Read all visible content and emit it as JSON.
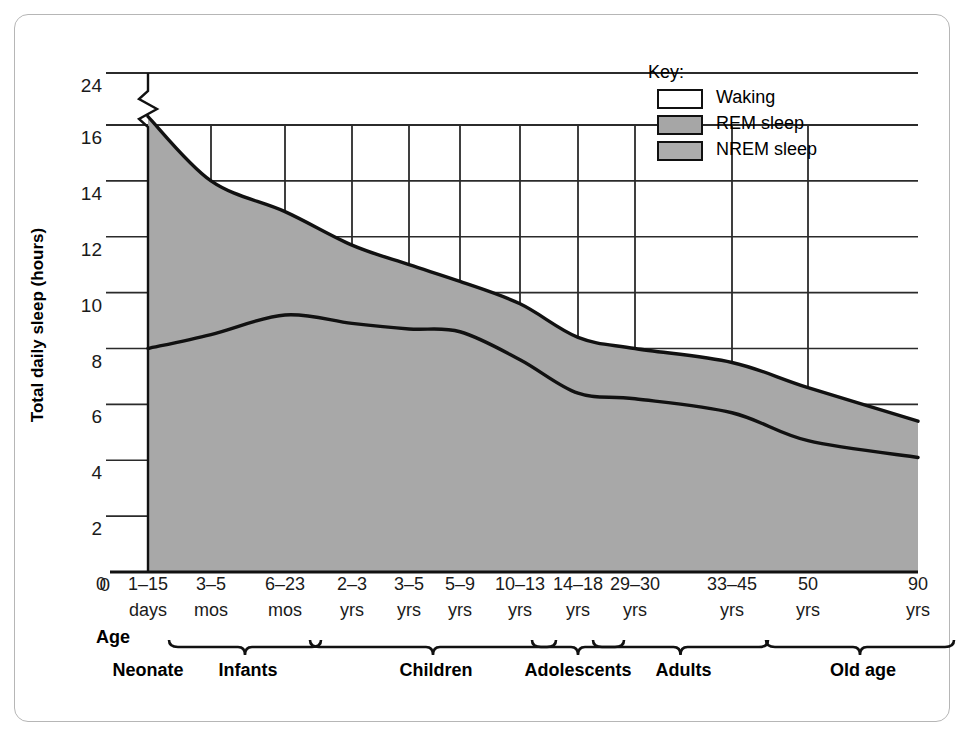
{
  "chart_data": {
    "type": "area",
    "title": "",
    "xlabel": "Age",
    "ylabel": "Total daily sleep (hours)",
    "ylim": [
      0,
      24
    ],
    "grid": true,
    "axis_break": {
      "between": [
        16,
        24
      ],
      "axis": "y"
    },
    "yticks": [
      {
        "value": 0,
        "label": "0"
      },
      {
        "value": 2,
        "label": "2"
      },
      {
        "value": 4,
        "label": "4"
      },
      {
        "value": 6,
        "label": "6"
      },
      {
        "value": 8,
        "label": "8"
      },
      {
        "value": 10,
        "label": "10"
      },
      {
        "value": 12,
        "label": "12"
      },
      {
        "value": 14,
        "label": "14"
      },
      {
        "value": 16,
        "label": "16"
      },
      {
        "value": 24,
        "label": "24"
      }
    ],
    "categories": [
      {
        "label": "1–15",
        "unit": "days",
        "group": "Neonate"
      },
      {
        "label": "3–5",
        "unit": "mos",
        "group": "Infants"
      },
      {
        "label": "6–23",
        "unit": "mos",
        "group": "Infants"
      },
      {
        "label": "2–3",
        "unit": "yrs",
        "group": "Children"
      },
      {
        "label": "3–5",
        "unit": "yrs",
        "group": "Children"
      },
      {
        "label": "5–9",
        "unit": "yrs",
        "group": "Children"
      },
      {
        "label": "10–13",
        "unit": "yrs",
        "group": "Children"
      },
      {
        "label": "14–18",
        "unit": "yrs",
        "group": "Adolescents"
      },
      {
        "label": "29–30",
        "unit": "yrs",
        "group": "Adults"
      },
      {
        "label": "33–45",
        "unit": "yrs",
        "group": "Adults"
      },
      {
        "label": "50",
        "unit": "yrs",
        "group": "Old age"
      },
      {
        "label": "90",
        "unit": "yrs",
        "group": "Old age"
      }
    ],
    "groups": [
      {
        "label": "Neonate",
        "from": "1–15 days",
        "to": "1–15 days",
        "bracket": false
      },
      {
        "label": "Infants",
        "from": "3–5 mos",
        "to": "6–23 mos",
        "bracket": true
      },
      {
        "label": "Children",
        "from": "2–3 yrs",
        "to": "10–13 yrs",
        "bracket": true
      },
      {
        "label": "Adolescents",
        "from": "14–18 yrs",
        "to": "14–18 yrs",
        "bracket": true
      },
      {
        "label": "Adults",
        "from": "29–30 yrs",
        "to": "33–45 yrs",
        "bracket": true
      },
      {
        "label": "Old age",
        "from": "50 yrs",
        "to": "90 yrs",
        "bracket": true
      }
    ],
    "series": [
      {
        "name": "Total sleep (top of REM band)",
        "description": "Upper boundary: total daily sleep = NREM + REM. Area above this line is Waking.",
        "values": [
          16.3,
          14.0,
          12.9,
          11.7,
          11.0,
          10.4,
          9.6,
          8.4,
          8.0,
          7.5,
          6.6,
          5.4
        ]
      },
      {
        "name": "NREM sleep (boundary between NREM and REM)",
        "description": "Lower boundary: hours of NREM sleep. Band between the two lines is REM sleep.",
        "values": [
          8.0,
          8.5,
          9.2,
          8.9,
          8.7,
          8.6,
          7.6,
          6.4,
          6.2,
          5.7,
          4.7,
          4.1
        ]
      }
    ],
    "legend": {
      "position": "top-right",
      "title": "Key:",
      "entries": [
        {
          "label": "Waking",
          "color": "#ffffff"
        },
        {
          "label": "REM sleep",
          "color": "#a6a6a6"
        },
        {
          "label": "NREM sleep",
          "color": "#adadad"
        }
      ]
    }
  },
  "colors": {
    "fill": "#a8a8a8",
    "line": "#111111",
    "grid": "#2b2b2b",
    "axis": "#111111",
    "frame": "#b6b6b6",
    "text": "#1a1a1a"
  }
}
